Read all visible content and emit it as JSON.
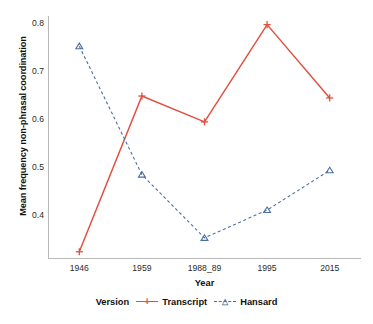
{
  "chart_data": {
    "type": "line",
    "title": "",
    "xlabel": "Year",
    "ylabel": "Mean frequency non-phrasal coordination",
    "categories": [
      "1946",
      "1959",
      "1988_89",
      "1995",
      "2015"
    ],
    "yticks": [
      0.4,
      0.5,
      0.6,
      0.7,
      0.8
    ],
    "ytick_labels": [
      "0.4",
      "0.5",
      "0.6",
      "0.7",
      "0.8"
    ],
    "ylim": [
      0.31,
      0.815
    ],
    "grid": false,
    "legend_position": "bottom",
    "legend_title": "Version",
    "series": [
      {
        "name": "Transcript",
        "color": "#e0513f",
        "linestyle": "solid",
        "marker": "plus",
        "values": [
          0.323,
          0.648,
          0.594,
          0.797,
          0.644
        ]
      },
      {
        "name": "Hansard",
        "color": "#4a6fa5",
        "linestyle": "dashed",
        "marker": "triangle",
        "values": [
          0.752,
          0.484,
          0.352,
          0.41,
          0.493
        ]
      }
    ]
  },
  "axes": {
    "ylabel": "Mean frequency non-phrasal coordination",
    "xlabel": "Year"
  },
  "legend": {
    "title": "Version",
    "items": [
      {
        "label": "Transcript",
        "color": "#e0513f",
        "marker": "+"
      },
      {
        "label": "Hansard",
        "color": "#4a6fa5",
        "marker": "△"
      }
    ]
  },
  "colors": {
    "transcript": "#e0513f",
    "hansard": "#4a6fa5",
    "axis": "#b9b9b9",
    "text": "#1a1a1a",
    "background": "#ffffff"
  }
}
